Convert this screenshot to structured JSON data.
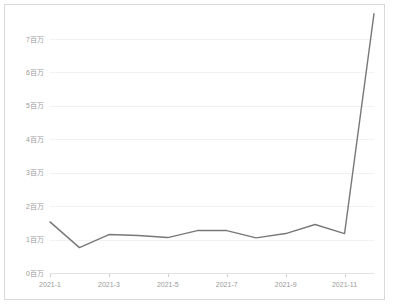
{
  "chart_data": {
    "type": "line",
    "title": "",
    "subtitle": "",
    "xlabel": "",
    "ylabel": "",
    "categories": [
      "2021-1",
      "2021-2",
      "2021-3",
      "2021-4",
      "2021-5",
      "2021-6",
      "2021-7",
      "2021-8",
      "2021-9",
      "2021-10",
      "2021-11",
      "2021-12"
    ],
    "x_tick_labels": [
      "2021-1",
      "2021-3",
      "2021-5",
      "2021-7",
      "2021-9",
      "2021-11"
    ],
    "x_tick_indices": [
      0,
      2,
      4,
      6,
      8,
      10
    ],
    "y_tick_labels": [
      "0百万",
      "1百万",
      "2百万",
      "3百万",
      "4百万",
      "5百万",
      "6百万",
      "7百万"
    ],
    "y_tick_values": [
      0,
      1000000,
      2000000,
      3000000,
      4000000,
      5000000,
      6000000,
      7000000
    ],
    "ylim": [
      0,
      7600000
    ],
    "xlim": [
      0,
      11
    ],
    "grid": true,
    "legend": false,
    "legend_position": "none",
    "series": [
      {
        "name": "series-1",
        "color": "#787878",
        "values": [
          1530000,
          760000,
          1150000,
          1120000,
          1060000,
          1270000,
          1270000,
          1050000,
          1180000,
          1450000,
          1180000,
          7760000
        ]
      }
    ]
  },
  "colors": {
    "line": "#787878",
    "grid": "#f2f2f2",
    "axis": "#e3e3e3",
    "border": "#d9d9d9",
    "tick_text": "#9a9a9a",
    "background": "#ffffff"
  }
}
